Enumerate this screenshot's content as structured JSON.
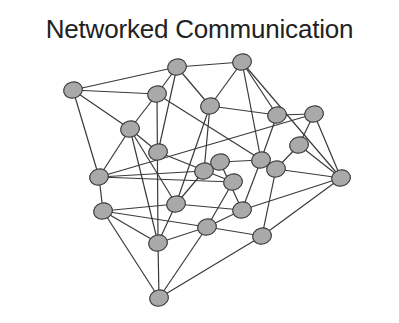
{
  "title": "Networked Communication",
  "colors": {
    "node_fill": "#a9a9a9",
    "node_stroke": "#3c3c3c",
    "edge": "#3a3a3a",
    "title": "#222222"
  },
  "nodes": [
    {
      "id": 0,
      "x": 73,
      "y": 90
    },
    {
      "id": 1,
      "x": 177,
      "y": 67
    },
    {
      "id": 2,
      "x": 242,
      "y": 62
    },
    {
      "id": 3,
      "x": 157,
      "y": 94
    },
    {
      "id": 4,
      "x": 210,
      "y": 106
    },
    {
      "id": 5,
      "x": 277,
      "y": 115
    },
    {
      "id": 6,
      "x": 314,
      "y": 114
    },
    {
      "id": 7,
      "x": 130,
      "y": 129
    },
    {
      "id": 8,
      "x": 158,
      "y": 152
    },
    {
      "id": 9,
      "x": 299,
      "y": 145
    },
    {
      "id": 10,
      "x": 220,
      "y": 162
    },
    {
      "id": 11,
      "x": 261,
      "y": 160
    },
    {
      "id": 12,
      "x": 204,
      "y": 171
    },
    {
      "id": 13,
      "x": 276,
      "y": 169
    },
    {
      "id": 14,
      "x": 99,
      "y": 177
    },
    {
      "id": 15,
      "x": 341,
      "y": 178
    },
    {
      "id": 16,
      "x": 233,
      "y": 182
    },
    {
      "id": 17,
      "x": 176,
      "y": 204
    },
    {
      "id": 18,
      "x": 103,
      "y": 211
    },
    {
      "id": 19,
      "x": 242,
      "y": 210
    },
    {
      "id": 20,
      "x": 207,
      "y": 227
    },
    {
      "id": 21,
      "x": 262,
      "y": 236
    },
    {
      "id": 22,
      "x": 158,
      "y": 243
    },
    {
      "id": 23,
      "x": 159,
      "y": 298
    }
  ],
  "edges": [
    [
      0,
      1
    ],
    [
      0,
      3
    ],
    [
      0,
      7
    ],
    [
      0,
      14
    ],
    [
      1,
      2
    ],
    [
      1,
      3
    ],
    [
      1,
      4
    ],
    [
      1,
      8
    ],
    [
      2,
      4
    ],
    [
      2,
      5
    ],
    [
      2,
      11
    ],
    [
      2,
      15
    ],
    [
      3,
      7
    ],
    [
      3,
      22
    ],
    [
      3,
      13
    ],
    [
      4,
      5
    ],
    [
      4,
      12
    ],
    [
      4,
      17
    ],
    [
      5,
      11
    ],
    [
      5,
      6
    ],
    [
      6,
      9
    ],
    [
      6,
      14
    ],
    [
      6,
      15
    ],
    [
      7,
      8
    ],
    [
      7,
      14
    ],
    [
      7,
      22
    ],
    [
      7,
      17
    ],
    [
      8,
      16
    ],
    [
      9,
      13
    ],
    [
      9,
      15
    ],
    [
      10,
      11
    ],
    [
      10,
      12
    ],
    [
      10,
      19
    ],
    [
      11,
      19
    ],
    [
      12,
      14
    ],
    [
      12,
      17
    ],
    [
      13,
      21
    ],
    [
      13,
      15
    ],
    [
      14,
      18
    ],
    [
      14,
      16
    ],
    [
      15,
      19
    ],
    [
      15,
      21
    ],
    [
      16,
      20
    ],
    [
      17,
      18
    ],
    [
      17,
      22
    ],
    [
      17,
      19
    ],
    [
      18,
      20
    ],
    [
      18,
      23
    ],
    [
      18,
      22
    ],
    [
      19,
      20
    ],
    [
      20,
      21
    ],
    [
      20,
      22
    ],
    [
      21,
      23
    ],
    [
      22,
      23
    ],
    [
      20,
      23
    ]
  ]
}
